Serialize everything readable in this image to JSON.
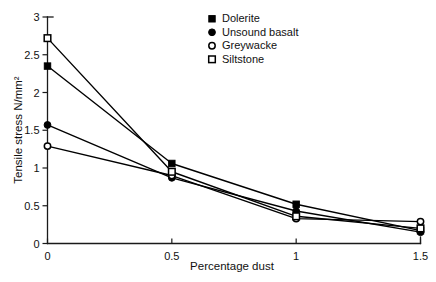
{
  "chart_data": {
    "type": "line",
    "title": "",
    "xlabel": "Percentage dust",
    "ylabel": "Tensile stress N/mm²",
    "x": [
      0,
      0.5,
      1,
      1.5
    ],
    "xlim": [
      0,
      1.5
    ],
    "ylim": [
      0,
      3
    ],
    "xticks": [
      "0",
      "0.5",
      "1",
      "1.5"
    ],
    "yticks": [
      "0",
      "0.5",
      "1",
      "1.5",
      "2",
      "2.5",
      "3"
    ],
    "grid": false,
    "legend_position": "top-center",
    "series": [
      {
        "name": "Dolerite",
        "marker": "filled-square",
        "values": [
          2.35,
          1.06,
          0.52,
          0.17
        ]
      },
      {
        "name": "Unsound basalt",
        "marker": "filled-circle",
        "values": [
          1.57,
          0.87,
          0.43,
          0.15
        ]
      },
      {
        "name": "Greywacke",
        "marker": "open-circle",
        "values": [
          1.29,
          0.9,
          0.33,
          0.29
        ]
      },
      {
        "name": "Siltstone",
        "marker": "open-square",
        "values": [
          2.72,
          0.95,
          0.36,
          0.2
        ]
      }
    ]
  },
  "legend": {
    "entries": [
      {
        "label": "Dolerite"
      },
      {
        "label": "Unsound basalt"
      },
      {
        "label": "Greywacke"
      },
      {
        "label": "Siltstone"
      }
    ]
  },
  "colors": {
    "ink": "#000000",
    "axis": "#1a1a1a",
    "background": "#ffffff"
  }
}
